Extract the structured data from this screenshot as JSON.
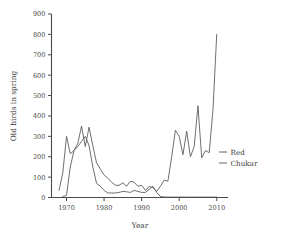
{
  "chart_data": {
    "type": "line",
    "title": "",
    "xlabel": "Year",
    "ylabel": "Old birds in spring",
    "xlim": [
      1966,
      2013
    ],
    "ylim": [
      0,
      900
    ],
    "xticks": [
      1970,
      1980,
      1990,
      2000,
      2010
    ],
    "xticklabels": [
      "1970",
      "1980",
      "1990",
      "2000",
      "2010"
    ],
    "yticks": [
      0,
      100,
      200,
      300,
      400,
      500,
      600,
      700,
      800,
      900
    ],
    "yticklabels": [
      "0",
      "100",
      "200",
      "300",
      "400",
      "500",
      "600",
      "700",
      "800",
      "900"
    ],
    "grid": false,
    "legend_position": "right",
    "legend": [
      "Red",
      "Chukar"
    ],
    "series": [
      {
        "name": "Red",
        "color": "#555555",
        "x": [
          1968,
          1969,
          1970,
          1971,
          1972,
          1973,
          1974,
          1975,
          1976,
          1977,
          1978,
          1979,
          1980,
          1981,
          1982,
          1983,
          1984,
          1985,
          1986,
          1987,
          1988,
          1989,
          1990,
          1991,
          1992,
          1993,
          1994,
          1995,
          1996,
          1997,
          1998,
          1999,
          2000,
          2001,
          2002,
          2003,
          2004,
          2005,
          2006,
          2007,
          2008,
          2009,
          2010
        ],
        "y": [
          35,
          120,
          300,
          215,
          230,
          265,
          350,
          250,
          345,
          255,
          170,
          140,
          110,
          95,
          75,
          60,
          60,
          72,
          55,
          80,
          75,
          55,
          60,
          35,
          55,
          48,
          30,
          55,
          85,
          80,
          200,
          330,
          300,
          210,
          325,
          200,
          250,
          450,
          195,
          230,
          220,
          430,
          800
        ]
      },
      {
        "name": "Chukar",
        "color": "#555555",
        "x": [
          1969,
          1970,
          1971,
          1972,
          1973,
          1974,
          1975,
          1976,
          1977,
          1978,
          1979,
          1980,
          1981,
          1982,
          1983,
          1984,
          1985,
          1986,
          1987,
          1988,
          1989,
          1990,
          1991,
          1992,
          1993,
          1994,
          1995,
          1996,
          1997,
          1998,
          1999,
          2000,
          2001,
          2002,
          2003,
          2004,
          2005,
          2006,
          2007,
          2008,
          2009,
          2010
        ],
        "y": [
          5,
          10,
          150,
          230,
          250,
          275,
          300,
          255,
          150,
          70,
          55,
          35,
          22,
          22,
          22,
          25,
          30,
          28,
          25,
          35,
          30,
          25,
          25,
          40,
          55,
          25,
          5,
          2,
          2,
          2,
          2,
          2,
          2,
          2,
          2,
          2,
          2,
          2,
          2,
          2,
          2,
          2
        ]
      }
    ]
  },
  "axes": {
    "ylabel": "Old birds in spring",
    "xlabel": "Year"
  },
  "legend": {
    "items": [
      {
        "label": "Red"
      },
      {
        "label": "Chukar"
      }
    ]
  }
}
